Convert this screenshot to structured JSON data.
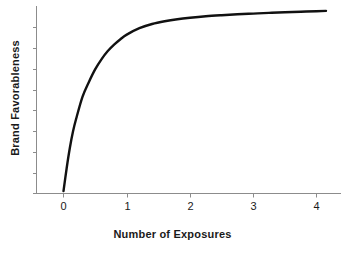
{
  "chart_data": {
    "type": "line",
    "title": "",
    "xlabel": "Number of Exposures",
    "ylabel": "Brand Favorableness",
    "xlim": [
      -0.25,
      4.35
    ],
    "ylim": [
      0,
      1
    ],
    "xticks": [
      0,
      1,
      2,
      3,
      4
    ],
    "xtick_labels": [
      "0",
      "1",
      "2",
      "3",
      "4"
    ],
    "yticks": [],
    "ytick_labels": [],
    "grid": false,
    "legend": null,
    "series": [
      {
        "name": "Brand Favorableness",
        "color": "#111111",
        "linewidth": 2.4,
        "x": [
          0.0,
          0.05,
          0.1,
          0.15,
          0.2,
          0.3,
          0.4,
          0.5,
          0.6,
          0.7,
          0.8,
          0.9,
          1.0,
          1.2,
          1.4,
          1.6,
          1.8,
          2.0,
          2.25,
          2.5,
          2.75,
          3.0,
          3.25,
          3.5,
          3.75,
          4.0,
          4.15
        ],
        "y": [
          0.005,
          0.13,
          0.24,
          0.33,
          0.4,
          0.52,
          0.6,
          0.67,
          0.725,
          0.77,
          0.805,
          0.835,
          0.86,
          0.895,
          0.918,
          0.933,
          0.944,
          0.952,
          0.96,
          0.966,
          0.971,
          0.975,
          0.979,
          0.982,
          0.985,
          0.988,
          0.99
        ]
      }
    ]
  },
  "axes": {
    "x_tick_labels": [
      "0",
      "1",
      "2",
      "3",
      "4"
    ],
    "x_title": "Number of Exposures",
    "y_title": "Brand Favorableness"
  },
  "colors": {
    "curve": "#111111",
    "axis": "#8c8c8c",
    "text": "#1a1a1a",
    "background": "#ffffff"
  }
}
